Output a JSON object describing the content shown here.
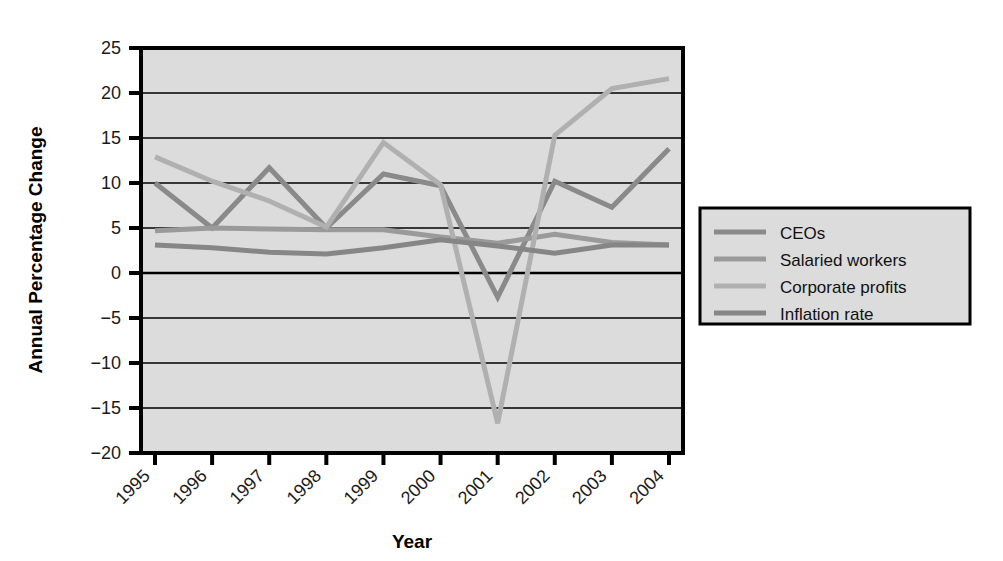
{
  "chart_data": {
    "type": "line",
    "title": "",
    "xlabel": "Year",
    "ylabel": "Annual Percentage Change",
    "categories": [
      "1995",
      "1996",
      "1997",
      "1998",
      "1999",
      "2000",
      "2001",
      "2002",
      "2003",
      "2004"
    ],
    "x": [
      1995,
      1996,
      1997,
      1998,
      1999,
      2000,
      2001,
      2002,
      2003,
      2004
    ],
    "ylim": [
      -20,
      25
    ],
    "yticks": [
      -20,
      -15,
      -10,
      -5,
      0,
      5,
      10,
      15,
      20,
      25
    ],
    "ytick_labels": [
      "−20",
      "−15",
      "−10",
      "−5",
      "0",
      "5",
      "10",
      "15",
      "20",
      "25"
    ],
    "grid": true,
    "legend_position": "right",
    "series": [
      {
        "name": "CEOs",
        "color": "#8a8a8a",
        "values": [
          10.0,
          5.0,
          11.7,
          5.0,
          11.0,
          9.7,
          -2.7,
          10.2,
          7.3,
          13.8
        ]
      },
      {
        "name": "Salaried workers",
        "color": "#9a9a9a",
        "values": [
          4.7,
          5.0,
          4.9,
          4.8,
          4.8,
          4.0,
          3.3,
          4.3,
          3.4,
          3.1
        ]
      },
      {
        "name": "Corporate profits",
        "color": "#b0b0b0",
        "values": [
          12.9,
          10.2,
          8.0,
          5.1,
          14.5,
          9.8,
          -16.7,
          15.3,
          20.5,
          21.6
        ]
      },
      {
        "name": "Inflation rate",
        "color": "#868686",
        "values": [
          3.1,
          2.8,
          2.3,
          2.1,
          2.8,
          3.7,
          3.0,
          2.2,
          3.1,
          3.1
        ]
      }
    ]
  },
  "legend": {
    "items": [
      {
        "label": "CEOs",
        "color": "#8a8a8a"
      },
      {
        "label": "Salaried workers",
        "color": "#9a9a9a"
      },
      {
        "label": "Corporate profits",
        "color": "#b0b0b0"
      },
      {
        "label": "Inflation rate",
        "color": "#868686"
      }
    ]
  },
  "axes": {
    "y_title": "Annual Percentage Change",
    "x_title": "Year"
  }
}
